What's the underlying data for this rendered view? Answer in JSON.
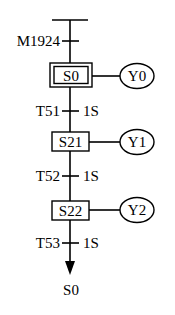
{
  "diagram": {
    "type": "sequential-function-chart",
    "entry_transition": {
      "label": "M1924"
    },
    "steps": [
      {
        "id": "S0",
        "initial": true,
        "action": "Y0"
      },
      {
        "id": "S21",
        "initial": false,
        "action": "Y1"
      },
      {
        "id": "S22",
        "initial": false,
        "action": "Y2"
      }
    ],
    "transitions": [
      {
        "label": "T51",
        "time": "1S"
      },
      {
        "label": "T52",
        "time": "1S"
      },
      {
        "label": "T53",
        "time": "1S"
      }
    ],
    "jump_target": "S0"
  }
}
